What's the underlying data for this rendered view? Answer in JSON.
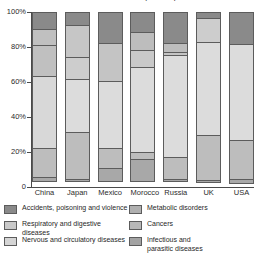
{
  "chart_data": {
    "type": "bar",
    "subtype": "stacked-100-percent",
    "title": "Causes of death by country",
    "xlabel": "",
    "ylabel": "",
    "ylim": [
      0,
      100
    ],
    "ytick_labels": [
      "100%",
      "80%",
      "60%",
      "40%",
      "20%",
      "0"
    ],
    "ytick_values": [
      100,
      80,
      60,
      40,
      20,
      0
    ],
    "grid": false,
    "legend_position": "bottom",
    "categories": [
      "China",
      "Japan",
      "Mexico",
      "Morocco",
      "Russia",
      "UK",
      "USA"
    ],
    "series": [
      {
        "name": "Infectious and parasitic diseases",
        "color": "#9a9a9a",
        "values": [
          3,
          2,
          8,
          13,
          2,
          2,
          3
        ]
      },
      {
        "name": "Cancers",
        "color": "#b3b3b3",
        "values": [
          17,
          27,
          12,
          5,
          13,
          26,
          23
        ]
      },
      {
        "name": "Nervous and circulatory diseases",
        "color": "#d5d5d5",
        "values": [
          42,
          31,
          39,
          49,
          59,
          54,
          55
        ]
      },
      {
        "name": "Respiratory and digestive diseases",
        "color": "#b8b8b8",
        "values": [
          18,
          13,
          22,
          10,
          2,
          0,
          0
        ]
      },
      {
        "name": "Metabolic disorders",
        "color": "#c4c4c4",
        "values": [
          10,
          19,
          1,
          11,
          6,
          14,
          0
        ]
      },
      {
        "name": "Accidents, poisoning and violence",
        "color": "#8a8a8a",
        "values": [
          10,
          8,
          18,
          12,
          18,
          4,
          19
        ]
      }
    ],
    "legend": {
      "column_left": [
        {
          "label": "Accidents, poisoning and violence",
          "color": "#8a8a8a"
        },
        {
          "label": "Respiratory and digestive diseases",
          "color": "#c9c9c9"
        },
        {
          "label": "Nervous and circulatory diseases",
          "color": "#d5d5d5"
        }
      ],
      "column_right": [
        {
          "label": "Metabolic disorders",
          "color": "#b0b0b0"
        },
        {
          "label": "Cancers",
          "color": "#b8b8b8"
        },
        {
          "label": "Infectious and\nparasitic diseases",
          "color": "#a3a3a3"
        }
      ]
    },
    "bars": [
      {
        "category": "China",
        "segments_top_to_bottom": [
          {
            "name": "Accidents, poisoning and violence",
            "value": 10,
            "color": "#8a8a8a"
          },
          {
            "name": "Metabolic disorders",
            "value": 10,
            "color": "#c0c0c0"
          },
          {
            "name": "Respiratory and digestive diseases",
            "value": 18,
            "color": "#c0c0c0"
          },
          {
            "name": "Nervous and circulatory diseases",
            "value": 42,
            "color": "#d8d8d8"
          },
          {
            "name": "Cancers",
            "value": 17,
            "color": "#bdbdbd"
          },
          {
            "name": "Infectious and parasitic diseases",
            "value": 3,
            "color": "#a8a8a8"
          }
        ]
      },
      {
        "category": "Japan",
        "segments_top_to_bottom": [
          {
            "name": "Accidents, poisoning and violence",
            "value": 8,
            "color": "#8a8a8a"
          },
          {
            "name": "Metabolic disorders",
            "value": 19,
            "color": "#c6c6c6"
          },
          {
            "name": "Respiratory and digestive diseases",
            "value": 13,
            "color": "#cdcdcd"
          },
          {
            "name": "Nervous and circulatory diseases",
            "value": 31,
            "color": "#dcdcdc"
          },
          {
            "name": "Cancers",
            "value": 27,
            "color": "#bdbdbd"
          },
          {
            "name": "Infectious and parasitic diseases",
            "value": 2,
            "color": "#a8a8a8"
          }
        ]
      },
      {
        "category": "Mexico",
        "segments_top_to_bottom": [
          {
            "name": "Accidents, poisoning and violence",
            "value": 18,
            "color": "#8a8a8a"
          },
          {
            "name": "Metabolic disorders",
            "value": 1,
            "color": "#b5b5b5"
          },
          {
            "name": "Respiratory and digestive diseases",
            "value": 22,
            "color": "#c4c4c4"
          },
          {
            "name": "Nervous and circulatory diseases",
            "value": 39,
            "color": "#dcdcdc"
          },
          {
            "name": "Cancers",
            "value": 12,
            "color": "#bdbdbd"
          },
          {
            "name": "Infectious and parasitic diseases",
            "value": 8,
            "color": "#a8a8a8"
          }
        ]
      },
      {
        "category": "Morocco",
        "segments_top_to_bottom": [
          {
            "name": "Accidents, poisoning and violence",
            "value": 12,
            "color": "#8a8a8a"
          },
          {
            "name": "Metabolic disorders",
            "value": 11,
            "color": "#bdbdbd"
          },
          {
            "name": "Respiratory and digestive diseases",
            "value": 10,
            "color": "#c9c9c9"
          },
          {
            "name": "Nervous and circulatory diseases",
            "value": 49,
            "color": "#dcdcdc"
          },
          {
            "name": "Cancers",
            "value": 5,
            "color": "#bdbdbd"
          },
          {
            "name": "Infectious and parasitic diseases",
            "value": 13,
            "color": "#a8a8a8"
          }
        ]
      },
      {
        "category": "Russia",
        "segments_top_to_bottom": [
          {
            "name": "Accidents, poisoning and violence",
            "value": 18,
            "color": "#8a8a8a"
          },
          {
            "name": "Metabolic disorders",
            "value": 6,
            "color": "#bdbdbd"
          },
          {
            "name": "Respiratory and digestive diseases",
            "value": 2,
            "color": "#c4c4c4"
          },
          {
            "name": "Nervous and circulatory diseases",
            "value": 59,
            "color": "#dcdcdc"
          },
          {
            "name": "Cancers",
            "value": 13,
            "color": "#bdbdbd"
          },
          {
            "name": "Infectious and parasitic diseases",
            "value": 2,
            "color": "#a8a8a8"
          }
        ]
      },
      {
        "category": "UK",
        "segments_top_to_bottom": [
          {
            "name": "Accidents, poisoning and violence",
            "value": 4,
            "color": "#8a8a8a"
          },
          {
            "name": "Metabolic disorders",
            "value": 14,
            "color": "#cdcdcd"
          },
          {
            "name": "Nervous and circulatory diseases",
            "value": 54,
            "color": "#dcdcdc"
          },
          {
            "name": "Cancers",
            "value": 26,
            "color": "#bdbdbd"
          },
          {
            "name": "Infectious and parasitic diseases",
            "value": 2,
            "color": "#a8a8a8"
          }
        ]
      },
      {
        "category": "USA",
        "segments_top_to_bottom": [
          {
            "name": "Accidents, poisoning and violence",
            "value": 19,
            "color": "#8a8a8a"
          },
          {
            "name": "Nervous and circulatory diseases",
            "value": 55,
            "color": "#dcdcdc"
          },
          {
            "name": "Cancers",
            "value": 23,
            "color": "#bdbdbd"
          },
          {
            "name": "Infectious and parasitic diseases",
            "value": 3,
            "color": "#a8a8a8"
          }
        ]
      }
    ]
  }
}
